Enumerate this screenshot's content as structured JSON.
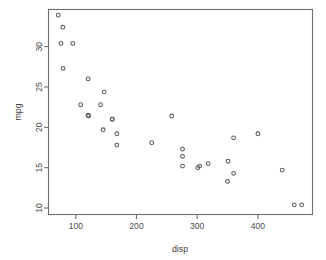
{
  "chart_data": {
    "type": "scatter",
    "title": "",
    "xlabel": "disp",
    "ylabel": "mpg",
    "xlim": [
      55,
      490
    ],
    "ylim": [
      9.2,
      34.6
    ],
    "xticks": [
      100,
      200,
      300,
      400
    ],
    "xtick_labels": [
      "100",
      "200",
      "300",
      "400"
    ],
    "yticks": [
      10,
      15,
      20,
      25,
      30
    ],
    "ytick_labels": [
      "10",
      "15",
      "20",
      "25",
      "30"
    ],
    "grid": false,
    "legend": null,
    "point_symbol": "open-circle",
    "point_color": "#5c5c5c",
    "x": [
      160,
      160,
      108,
      258,
      360,
      225,
      360,
      146.7,
      140.8,
      167.6,
      167.6,
      275.8,
      275.8,
      275.8,
      472,
      460,
      440,
      78.7,
      75.7,
      71.1,
      120.1,
      318,
      304,
      350,
      400,
      79,
      120.3,
      95.1,
      351,
      145,
      301,
      121
    ],
    "y": [
      21.0,
      21.0,
      22.8,
      21.4,
      18.7,
      18.1,
      14.3,
      24.4,
      22.8,
      19.2,
      17.8,
      16.4,
      17.3,
      15.2,
      10.4,
      10.4,
      14.7,
      32.4,
      30.4,
      33.9,
      21.5,
      15.5,
      15.2,
      13.3,
      19.2,
      27.3,
      26.0,
      30.4,
      15.8,
      19.7,
      15.0,
      21.4
    ],
    "series": [
      {
        "name": "mtcars",
        "points": [
          [
            160,
            21.0
          ],
          [
            160,
            21.0
          ],
          [
            108,
            22.8
          ],
          [
            258,
            21.4
          ],
          [
            360,
            18.7
          ],
          [
            225,
            18.1
          ],
          [
            360,
            14.3
          ],
          [
            146.7,
            24.4
          ],
          [
            140.8,
            22.8
          ],
          [
            167.6,
            19.2
          ],
          [
            167.6,
            17.8
          ],
          [
            275.8,
            16.4
          ],
          [
            275.8,
            17.3
          ],
          [
            275.8,
            15.2
          ],
          [
            472,
            10.4
          ],
          [
            460,
            10.4
          ],
          [
            440,
            14.7
          ],
          [
            78.7,
            32.4
          ],
          [
            75.7,
            30.4
          ],
          [
            71.1,
            33.9
          ],
          [
            120.1,
            21.5
          ],
          [
            318,
            15.5
          ],
          [
            304,
            15.2
          ],
          [
            350,
            13.3
          ],
          [
            400,
            19.2
          ],
          [
            79,
            27.3
          ],
          [
            120.3,
            26.0
          ],
          [
            95.1,
            30.4
          ],
          [
            351,
            15.8
          ],
          [
            145,
            19.7
          ],
          [
            301,
            15.0
          ],
          [
            121,
            21.4
          ]
        ]
      }
    ]
  },
  "figure": {
    "frame_color": "#6e6e6e",
    "background_color": "#ffffff",
    "point_count": 32
  }
}
